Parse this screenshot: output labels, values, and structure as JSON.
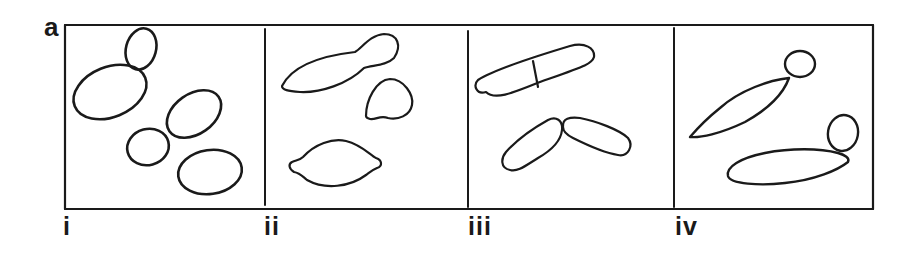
{
  "figure": {
    "panel_letter": "a",
    "subpanels": [
      {
        "label": "i"
      },
      {
        "label": "ii"
      },
      {
        "label": "iii"
      },
      {
        "label": "iv"
      }
    ],
    "stroke_color": "#1a1a1a",
    "background_color": "#ffffff"
  }
}
